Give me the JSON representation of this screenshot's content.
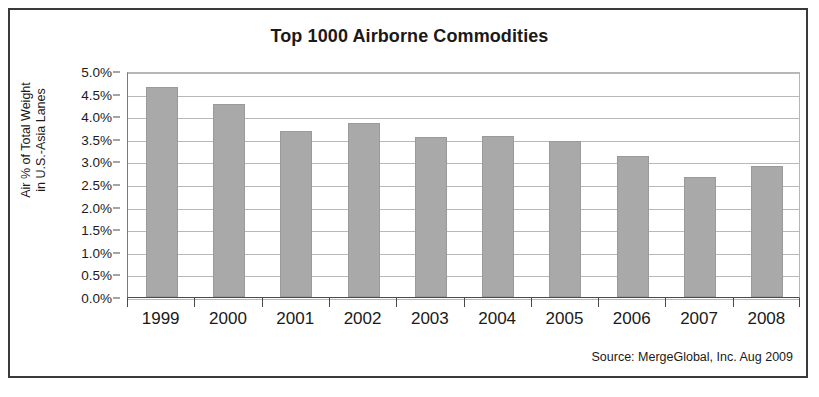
{
  "chart_data": {
    "type": "bar",
    "title": "Top 1000 Airborne Commodities",
    "xlabel": "",
    "ylabel": "Air % of Total Weight\nin U.S.-Asia Lanes",
    "categories": [
      "1999",
      "2000",
      "2001",
      "2002",
      "2003",
      "2004",
      "2005",
      "2006",
      "2007",
      "2008"
    ],
    "values": [
      4.65,
      4.28,
      3.67,
      3.85,
      3.55,
      3.57,
      3.45,
      3.12,
      2.66,
      2.89
    ],
    "value_unit": "%",
    "ylim": [
      0.0,
      5.0
    ],
    "ytick_values": [
      5.0,
      4.5,
      4.0,
      3.5,
      3.0,
      2.5,
      2.0,
      1.5,
      1.0,
      0.5,
      0.0
    ],
    "ytick_labels": [
      "5.0%",
      "4.5%",
      "4.0%",
      "3.5%",
      "3.0%",
      "2.5%",
      "2.0%",
      "1.5%",
      "1.0%",
      "0.5%",
      "0.0%"
    ],
    "grid": true,
    "legend": false,
    "series": [
      {
        "name": "Air % of Total Weight in U.S.-Asia Lanes",
        "values": [
          4.65,
          4.28,
          3.67,
          3.85,
          3.55,
          3.57,
          3.45,
          3.12,
          2.66,
          2.89
        ]
      }
    ],
    "bar_color": "#a9a9a9",
    "annotations": [
      "Source: MergeGlobal, Inc. Aug 2009"
    ]
  },
  "figure": {
    "title": "Top 1000 Airborne Commodities",
    "y_axis_title": "Air % of Total Weight\nin U.S.-Asia Lanes",
    "source_note": "Source: MergeGlobal, Inc. Aug 2009",
    "border_color": "#3a3a3a",
    "background_color": "#ffffff"
  }
}
